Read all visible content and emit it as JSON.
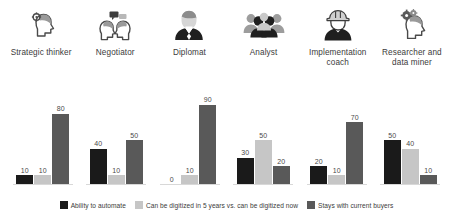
{
  "chart_data": {
    "type": "bar",
    "title": "",
    "subtitle": "",
    "xlabel": "",
    "ylabel": "",
    "ylim": [
      0,
      100
    ],
    "grid": false,
    "legend_position": "bottom",
    "categories": [
      "Strategic thinker",
      "Negotiator",
      "Diplomat",
      "Analyst",
      "Implementation coach",
      "Researcher and data miner"
    ],
    "series": [
      {
        "name": "Ability to automate",
        "color": "#1a1a1a",
        "values": [
          10,
          40,
          0,
          30,
          20,
          50
        ]
      },
      {
        "name": "Can be digitized in 5 years vs. can be digitized now",
        "color": "#c6c6c6",
        "values": [
          10,
          10,
          10,
          50,
          10,
          40
        ]
      },
      {
        "name": "Stays with current buyers",
        "color": "#595959",
        "values": [
          80,
          50,
          90,
          20,
          70,
          10
        ]
      }
    ]
  },
  "icons": [
    {
      "name": "head-with-gear-icon",
      "label": "Strategic thinker"
    },
    {
      "name": "two-heads-speech-bubbles-icon",
      "label": "Negotiator"
    },
    {
      "name": "person-suit-tie-icon",
      "label": "Diplomat"
    },
    {
      "name": "group-of-people-icon",
      "label": "Analyst"
    },
    {
      "name": "person-hard-hat-icon",
      "label": "Implementation coach"
    },
    {
      "name": "head-with-gears-icon",
      "label": "Researcher and data miner"
    }
  ],
  "legend": {
    "items": [
      {
        "label": "Ability to automate",
        "color": "#1a1a1a"
      },
      {
        "label": "Can be digitized in 5 years vs. can be digitized now",
        "color": "#c6c6c6"
      },
      {
        "label": "Stays with current buyers",
        "color": "#595959"
      }
    ]
  }
}
